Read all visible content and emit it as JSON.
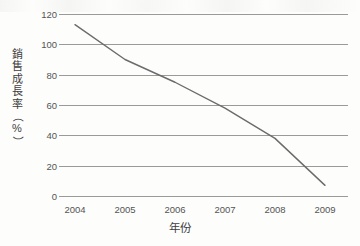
{
  "chart_data": {
    "type": "line",
    "title": "",
    "xlabel": "年份",
    "ylabel": "銷售成長率（%）",
    "ylabel_chars": [
      "銷",
      "售",
      "成",
      "長",
      "率",
      "（",
      "%",
      "）"
    ],
    "categories": [
      "2004",
      "2005",
      "2006",
      "2007",
      "2008",
      "2009"
    ],
    "values": [
      113,
      90,
      75,
      58,
      38,
      7
    ],
    "series": [
      {
        "name": "銷售成長率",
        "values": [
          113,
          90,
          75,
          58,
          38,
          7
        ]
      }
    ],
    "yticks": [
      0,
      20,
      40,
      60,
      80,
      100,
      120
    ],
    "ylim": [
      0,
      120
    ],
    "xlim": [
      "2004",
      "2009"
    ],
    "grid": "horizontal",
    "legend": "none",
    "line_color": "#6b6b6b",
    "grid_color": "#9a9a9a",
    "background_color": "#fdfdfc",
    "unit": "%"
  },
  "axes": {
    "y_axis_name": "y-axis",
    "x_axis_name": "x-axis"
  }
}
